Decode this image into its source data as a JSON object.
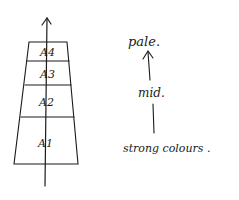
{
  "diagram": {
    "type": "hand-drawn layered trapezoid with direction arrow",
    "stack": {
      "layers": [
        {
          "label": "A4",
          "position": "top"
        },
        {
          "label": "A3",
          "position": "upper-middle"
        },
        {
          "label": "A2",
          "position": "lower-middle"
        },
        {
          "label": "A1",
          "position": "bottom"
        }
      ],
      "arrow_direction": "up"
    },
    "legend": {
      "top_label": "pale.",
      "middle_label": "mid.",
      "bottom_label": "strong colours .",
      "arrow_direction": "up"
    },
    "colors": {
      "ink": "#1a1a1a",
      "background": "#ffffff"
    }
  }
}
